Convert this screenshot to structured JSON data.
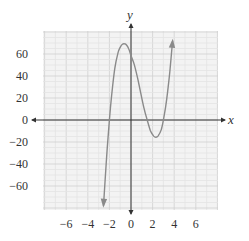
{
  "chart_data": {
    "type": "line",
    "title": "",
    "xlabel": "x",
    "ylabel": "y",
    "xlim": [
      -8,
      8
    ],
    "ylim": [
      -80,
      80
    ],
    "grid": true,
    "x_ticks": [
      -6,
      -4,
      -2,
      0,
      2,
      4,
      6
    ],
    "x_tick_labels": [
      "−6",
      "−4",
      "−2",
      "0",
      "2",
      "4",
      "6"
    ],
    "y_ticks": [
      60,
      40,
      20,
      0,
      -20,
      -40,
      -60
    ],
    "y_tick_labels": [
      "60",
      "40",
      "20",
      "0",
      "−20",
      "−40",
      "−60"
    ],
    "series": [
      {
        "name": "cubic",
        "description": "Cubic curve with arrowheads at both ends; local max near (-0.6, 69), local min near (2.3, -15); x-intercepts near -2, 1.5, 3",
        "x": [
          -2.55,
          -2.4,
          -2.2,
          -2.0,
          -1.8,
          -1.5,
          -1.2,
          -1.0,
          -0.8,
          -0.6,
          -0.4,
          -0.2,
          0.0,
          0.3,
          0.6,
          0.9,
          1.2,
          1.5,
          1.8,
          2.1,
          2.3,
          2.5,
          2.8,
          3.0,
          3.2,
          3.4,
          3.6,
          3.85
        ],
        "y": [
          -78,
          -55,
          -26,
          0,
          22,
          47,
          61,
          66,
          68.8,
          69.3,
          68,
          64.5,
          58.5,
          50.5,
          38.5,
          24.6,
          10.8,
          0,
          -9.7,
          -14.6,
          -15.6,
          -14.6,
          -9,
          0,
          11.6,
          26.3,
          44.5,
          72
        ],
        "color": "#8a8a8a",
        "arrow_start": true,
        "arrow_end": true
      }
    ],
    "legend": null
  },
  "colors": {
    "grid_minor": "#e3e3e3",
    "grid_major": "#cfcfcf",
    "grid_bg": "#f3f3f3",
    "axis": "#333333",
    "curve": "#8a8a8a"
  }
}
